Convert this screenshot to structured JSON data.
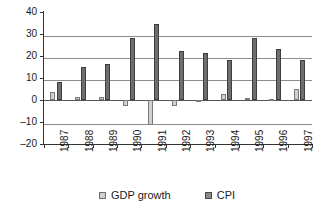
{
  "chart_data": {
    "type": "bar",
    "title": "",
    "xlabel": "",
    "ylabel": "",
    "ylim": [
      -20,
      40
    ],
    "ytick_values": [
      40,
      30,
      20,
      10,
      0,
      -10,
      -20
    ],
    "ytick_labels": [
      "40",
      "30",
      "20",
      "10",
      "0",
      "–10",
      "–20"
    ],
    "grid": true,
    "grid_axis": "y",
    "legend_position": "bottom",
    "categories": [
      "1987",
      "1988",
      "1989",
      "1990",
      "1991",
      "1992",
      "1993",
      "1994",
      "1995",
      "1996",
      "1997"
    ],
    "series": [
      {
        "name": "GDP growth",
        "color": "#d0d0d0",
        "values": [
          3.5,
          1.2,
          1.4,
          -2.8,
          -11.2,
          -2.5,
          -0.6,
          2.8,
          1.0,
          0.6,
          4.8
        ]
      },
      {
        "name": "CPI",
        "color": "#6e6e6e",
        "values": [
          8.0,
          15.0,
          16.5,
          28.2,
          34.6,
          22.2,
          21.4,
          18.3,
          28.1,
          23.4,
          18.1
        ]
      }
    ]
  },
  "legend": {
    "items": [
      {
        "label": "GDP growth",
        "swatch": "gdp-swatch-icon"
      },
      {
        "label": "CPI",
        "swatch": "cpi-swatch-icon"
      }
    ]
  }
}
